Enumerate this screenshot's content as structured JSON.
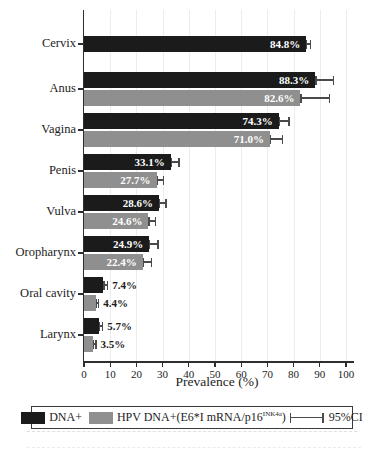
{
  "colors": {
    "bar_black": "#1b1b1b",
    "bar_gray": "#8f8f8f",
    "error_bar": "#4a4a4a",
    "axis": "#2e2e2e",
    "grid": "#ececec",
    "label_inside": "#ffffff",
    "text": "#1c1c1c"
  },
  "figure": {
    "legend": {
      "dna_label": "DNA+",
      "mrna_label_prefix": "HPV DNA+(E6*I mRNA/p16",
      "mrna_label_sup": "INK4a",
      "mrna_label_suffix": ")",
      "ci_label": "95%CI"
    }
  },
  "chart_data": {
    "type": "bar",
    "orientation": "horizontal",
    "title": "",
    "xlabel": "Prevalence (%)",
    "xlim": [
      0,
      100
    ],
    "xticks": [
      0,
      10,
      20,
      30,
      40,
      50,
      60,
      70,
      80,
      90,
      100
    ],
    "grid": true,
    "legend_position": "bottom",
    "categories": [
      "Cervix",
      "Anus",
      "Vagina",
      "Penis",
      "Vulva",
      "Oropharynx",
      "Oral cavity",
      "Larynx"
    ],
    "series": [
      {
        "name": "DNA+",
        "color": "#1b1b1b",
        "values": [
          84.8,
          88.3,
          74.3,
          33.1,
          28.6,
          24.9,
          7.4,
          5.7
        ],
        "ci_high": [
          86.8,
          95.5,
          78.5,
          36.5,
          31.5,
          28.5,
          9.3,
          7.3
        ],
        "labels": [
          "84.8%",
          "88.3%",
          "74.3%",
          "33.1%",
          "28.6%",
          "24.9%",
          "7.4%",
          "5.7%"
        ]
      },
      {
        "name": "HPV DNA+(E6*I mRNA/p16INK4a)",
        "color": "#8f8f8f",
        "values": [
          null,
          82.6,
          71.0,
          27.7,
          24.6,
          22.4,
          4.4,
          3.5
        ],
        "ci_high": [
          null,
          94.0,
          76.0,
          30.5,
          27.5,
          26.0,
          5.8,
          4.8
        ],
        "labels": [
          null,
          "82.6%",
          "71.0%",
          "27.7%",
          "24.6%",
          "22.4%",
          "4.4%",
          "3.5%"
        ]
      }
    ],
    "error_bars": "95%CI"
  }
}
